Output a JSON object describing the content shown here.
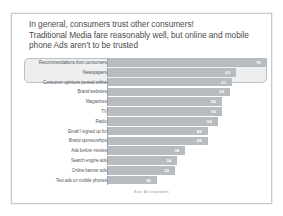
{
  "slide": {
    "title_lines": [
      "In general, consumers trust other consumers!",
      "Traditional Media fare reasonably well, but online and mobile",
      "phone Ads aren't to be trusted"
    ],
    "footnote": "Base: All respondents",
    "title_color": "#4c4c4c",
    "bar_color": "#b7bcc0",
    "highlight_color": "#cdd2d6",
    "border_color": "#c9c9c9"
  },
  "chart_data": {
    "type": "bar",
    "orientation": "horizontal",
    "title": "In general, consumers trust other consumers! Traditional Media fare reasonably well, but online and mobile phone Ads aren't to be trusted",
    "xlabel": "",
    "ylabel": "",
    "xlim": [
      0,
      80
    ],
    "grid": false,
    "legend": "none",
    "annotation": "Base: All respondents",
    "highlighted_categories": [
      "Recommendations from consumers",
      "Newspapers",
      "Consumer opinions posted online"
    ],
    "categories": [
      "Recommendations from consumers",
      "Newspapers",
      "Consumer opinions posted online",
      "Brand websites",
      "Magazines",
      "TV",
      "Radio",
      "Email I signed up for",
      "Brand sponsorships",
      "Ads before movies",
      "Search engine ads",
      "Online banner ads",
      "Text ads on mobile phones"
    ],
    "values": [
      78,
      63,
      61,
      60,
      56,
      56,
      54,
      49,
      49,
      38,
      34,
      33,
      24
    ]
  }
}
